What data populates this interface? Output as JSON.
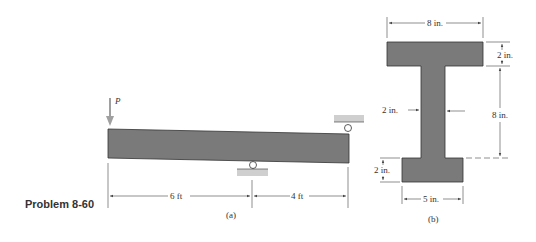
{
  "problem_label": "Problem 8-60",
  "figure_a": {
    "caption": "(a)",
    "load_label": "P",
    "dim_left": "6 ft",
    "dim_right": "4 ft"
  },
  "figure_b": {
    "caption": "(b)",
    "top_width": "8 in.",
    "top_flange_thickness": "2 in.",
    "web_height": "8 in.",
    "web_thickness": "2 in.",
    "bottom_flange_thickness": "2 in.",
    "bottom_width": "5 in."
  },
  "colors": {
    "section_fill": "#7a7a7a",
    "support_fill": "#cfcfcf",
    "load_arrow": "#a0a0a0",
    "dim_line": "#444444"
  }
}
